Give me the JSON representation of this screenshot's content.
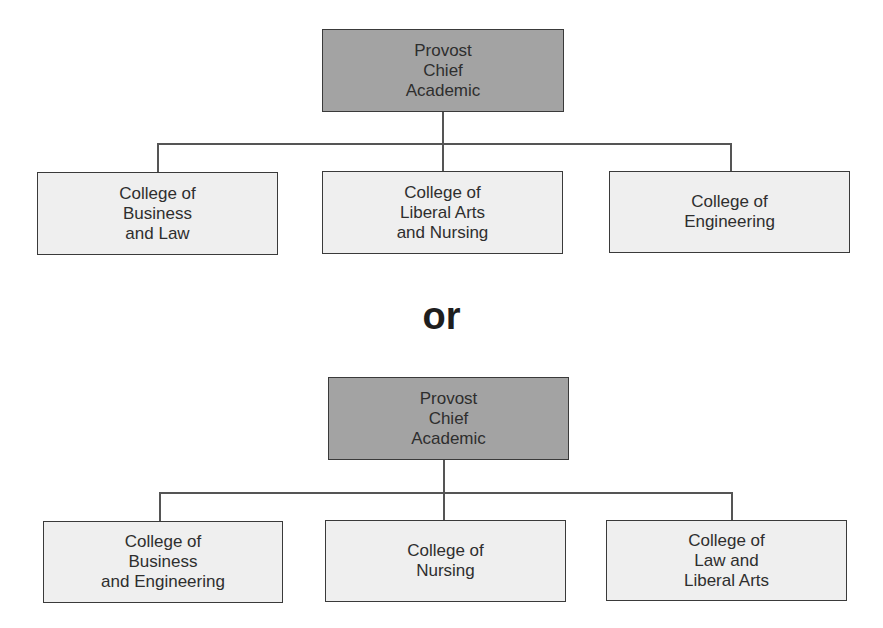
{
  "charts": [
    {
      "name": "option-1",
      "head": {
        "label": "Provost\nChief\nAcademic"
      },
      "children": [
        {
          "label": "College of\nBusiness\nand Law"
        },
        {
          "label": "College of\nLiberal Arts\nand Nursing"
        },
        {
          "label": "College of\nEngineering"
        }
      ]
    },
    {
      "name": "option-2",
      "head": {
        "label": "Provost\nChief\nAcademic"
      },
      "children": [
        {
          "label": "College of\nBusiness\nand Engineering"
        },
        {
          "label": "College of\nNursing"
        },
        {
          "label": "College of\nLaw and\nLiberal Arts"
        }
      ]
    }
  ],
  "separator": "or",
  "colors": {
    "head_fill": "#a3a3a3",
    "child_fill": "#efefef",
    "border": "#3a3a3a"
  }
}
